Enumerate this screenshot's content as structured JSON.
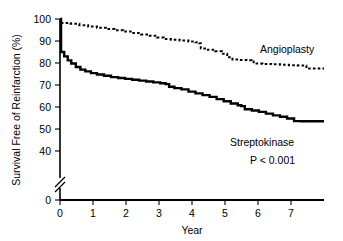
{
  "chart_data": {
    "type": "line",
    "title": "",
    "xlabel": "Year",
    "ylabel": "Survival Free of Reinfarction (%)",
    "xlim": [
      0,
      7.5
    ],
    "ylim": [
      0,
      100
    ],
    "y_axis_break": {
      "present": true,
      "between": [
        0,
        40
      ],
      "glyph": "//"
    },
    "grid": false,
    "legend_position": "inline-annotation",
    "xticks": [
      0,
      1,
      2,
      3,
      4,
      5,
      6,
      7
    ],
    "xticklabels": [
      "0",
      "1",
      "2",
      "3",
      "4",
      "5",
      "6",
      "7"
    ],
    "yticks": [
      0,
      40,
      50,
      60,
      70,
      80,
      90,
      100
    ],
    "yticklabels": [
      "0",
      "40",
      "50",
      "60",
      "70",
      "80",
      "90",
      "100"
    ],
    "annotations": [
      {
        "text": "Angioplasty",
        "x": 5.9,
        "y": 85.5
      },
      {
        "text": "Streptokinase",
        "x": 6.15,
        "y": 49.0
      },
      {
        "text": "P < 0.001",
        "x": 6.45,
        "y": 41.5
      }
    ],
    "series": [
      {
        "name": "Angioplasty",
        "linestyle": "dotted",
        "color": "#000000",
        "linewidth": 2.0,
        "final_value": 77.5,
        "points": [
          [
            0.0,
            100.0
          ],
          [
            0.02,
            98.2
          ],
          [
            0.3,
            97.8
          ],
          [
            0.55,
            97.2
          ],
          [
            0.8,
            96.6
          ],
          [
            1.05,
            96.0
          ],
          [
            1.3,
            95.4
          ],
          [
            1.55,
            94.9
          ],
          [
            1.8,
            94.3
          ],
          [
            2.05,
            93.6
          ],
          [
            2.3,
            93.0
          ],
          [
            2.55,
            92.4
          ],
          [
            2.75,
            91.6
          ],
          [
            2.95,
            90.9
          ],
          [
            3.15,
            90.6
          ],
          [
            3.4,
            90.2
          ],
          [
            3.65,
            89.8
          ],
          [
            3.85,
            89.4
          ],
          [
            3.95,
            89.0
          ],
          [
            4.0,
            86.6
          ],
          [
            4.2,
            86.0
          ],
          [
            4.4,
            85.3
          ],
          [
            4.6,
            84.2
          ],
          [
            4.75,
            82.6
          ],
          [
            4.9,
            81.6
          ],
          [
            5.1,
            81.4
          ],
          [
            5.3,
            81.3
          ],
          [
            5.45,
            81.2
          ],
          [
            5.5,
            79.8
          ],
          [
            5.75,
            79.6
          ],
          [
            6.0,
            79.4
          ],
          [
            6.25,
            79.2
          ],
          [
            6.5,
            79.0
          ],
          [
            6.75,
            78.9
          ],
          [
            6.95,
            78.8
          ],
          [
            7.0,
            77.5
          ],
          [
            7.5,
            77.5
          ]
        ]
      },
      {
        "name": "Streptokinase",
        "linestyle": "solid",
        "color": "#000000",
        "linewidth": 2.4,
        "final_value": 53.5,
        "points": [
          [
            0.0,
            100.0
          ],
          [
            0.03,
            85.0
          ],
          [
            0.12,
            83.0
          ],
          [
            0.22,
            81.2
          ],
          [
            0.32,
            79.8
          ],
          [
            0.45,
            78.2
          ],
          [
            0.58,
            77.0
          ],
          [
            0.72,
            76.2
          ],
          [
            0.88,
            75.4
          ],
          [
            1.05,
            74.8
          ],
          [
            1.25,
            74.2
          ],
          [
            1.45,
            73.6
          ],
          [
            1.65,
            73.2
          ],
          [
            1.85,
            72.8
          ],
          [
            2.05,
            72.4
          ],
          [
            2.25,
            72.0
          ],
          [
            2.45,
            71.6
          ],
          [
            2.65,
            71.2
          ],
          [
            2.85,
            70.8
          ],
          [
            3.0,
            70.4
          ],
          [
            3.1,
            69.2
          ],
          [
            3.25,
            68.6
          ],
          [
            3.45,
            68.0
          ],
          [
            3.65,
            67.0
          ],
          [
            3.85,
            66.2
          ],
          [
            4.05,
            65.4
          ],
          [
            4.25,
            64.6
          ],
          [
            4.45,
            63.6
          ],
          [
            4.65,
            62.6
          ],
          [
            4.85,
            61.6
          ],
          [
            5.05,
            60.8
          ],
          [
            5.15,
            60.4
          ],
          [
            5.25,
            59.0
          ],
          [
            5.45,
            58.4
          ],
          [
            5.65,
            57.8
          ],
          [
            5.85,
            57.0
          ],
          [
            6.05,
            56.2
          ],
          [
            6.25,
            55.6
          ],
          [
            6.45,
            54.8
          ],
          [
            6.65,
            53.6
          ],
          [
            6.85,
            53.5
          ],
          [
            7.5,
            53.5
          ]
        ]
      }
    ]
  },
  "axes": {
    "x_title": "Year",
    "y_title": "Survival Free of Reinfarction (%)"
  },
  "labels": {
    "angioplasty": "Angioplasty",
    "streptokinase": "Streptokinase",
    "pvalue": "P < 0.001"
  }
}
